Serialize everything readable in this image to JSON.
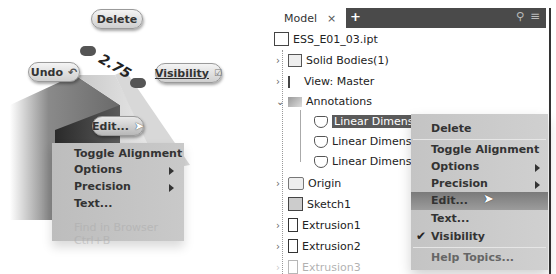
{
  "marking_menu": {
    "delete_label": "Delete",
    "undo_label": "Undo",
    "visibility_label": "Visibility",
    "edit_label": "Edit...",
    "dimension_value": "2.75",
    "overflow_menu": [
      {
        "label": "Toggle Alignment",
        "submenu": false
      },
      {
        "label": "Options",
        "submenu": true
      },
      {
        "label": "Precision",
        "submenu": true
      },
      {
        "label": "Text...",
        "submenu": false
      },
      {
        "label": "Find in Browser   Ctrl+B",
        "submenu": false,
        "faded": true
      }
    ]
  },
  "browser": {
    "tab_label": "Model",
    "tab_close": "×",
    "add_tab": "+",
    "tree": [
      {
        "label": "ESS_E01_03.ipt",
        "icon": "part-icon",
        "level": 0
      },
      {
        "label": "Solid Bodies(1)",
        "icon": "solid-bodies-icon",
        "level": 1,
        "expander": "›"
      },
      {
        "label": "View: Master",
        "icon": "view-icon",
        "level": 1,
        "expander": "›"
      },
      {
        "label": "Annotations",
        "icon": "annotations-icon",
        "level": 1,
        "expander": "⌄"
      },
      {
        "label": "Linear Dimension",
        "icon": "dimension-icon",
        "level": 2,
        "selected": true
      },
      {
        "label": "Linear Dimension",
        "icon": "dimension-icon",
        "level": 2
      },
      {
        "label": "Linear Dimension",
        "icon": "dimension-icon",
        "level": 2
      },
      {
        "label": "Origin",
        "icon": "folder-icon",
        "level": 1,
        "expander": "›"
      },
      {
        "label": "Sketch1",
        "icon": "sketch-icon",
        "level": 1
      },
      {
        "label": "Extrusion1",
        "icon": "extrusion-icon",
        "level": 1,
        "expander": "›"
      },
      {
        "label": "Extrusion2",
        "icon": "extrusion-icon",
        "level": 1,
        "expander": "›"
      },
      {
        "label": "Extrusion3",
        "icon": "extrusion-icon",
        "level": 1,
        "expander": "›",
        "faded": true
      }
    ],
    "context_menu": [
      {
        "label": "Delete"
      },
      {
        "label": "Toggle Alignment"
      },
      {
        "label": "Options",
        "submenu": true
      },
      {
        "label": "Precision",
        "submenu": true
      },
      {
        "label": "Edit...",
        "highlighted": true
      },
      {
        "label": "Text..."
      },
      {
        "label": "Visibility",
        "checked": true,
        "check": "✔"
      },
      {
        "label": "Help Topics..."
      }
    ]
  }
}
